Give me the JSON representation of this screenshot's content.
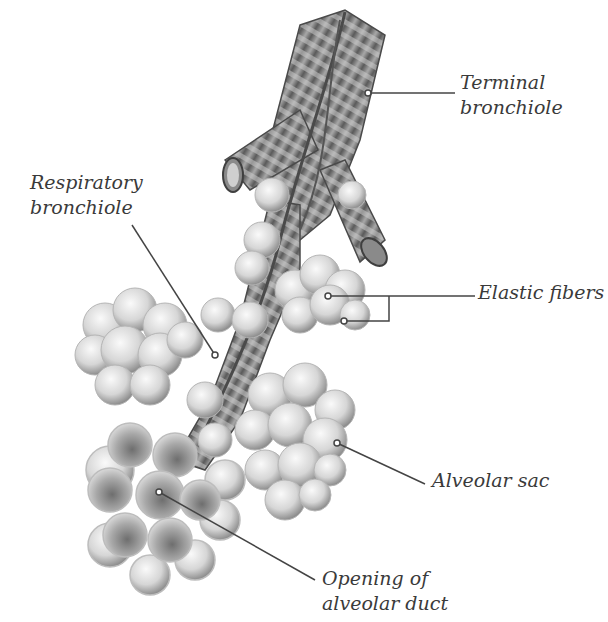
{
  "diagram": {
    "palette": {
      "background": "#ffffff",
      "label_text": "#3a3a3a",
      "leader_line": "#444444",
      "tube_dark": "#5a5a5a",
      "tube_light": "#bdbdbd",
      "alveolus_light": "#ececec",
      "alveolus_shadow": "#9a9a9a"
    },
    "labels": [
      {
        "id": "terminal-bronchiole",
        "lines": [
          "Terminal",
          "bronchiole"
        ]
      },
      {
        "id": "respiratory-bronchiole",
        "lines": [
          "Respiratory",
          "bronchiole"
        ]
      },
      {
        "id": "elastic-fibers",
        "lines": [
          "Elastic fibers"
        ]
      },
      {
        "id": "alveolar-sac",
        "lines": [
          "Alveolar sac"
        ]
      },
      {
        "id": "opening-of-alveolar-duct",
        "lines": [
          "Opening of",
          "alveolar duct"
        ]
      }
    ]
  }
}
